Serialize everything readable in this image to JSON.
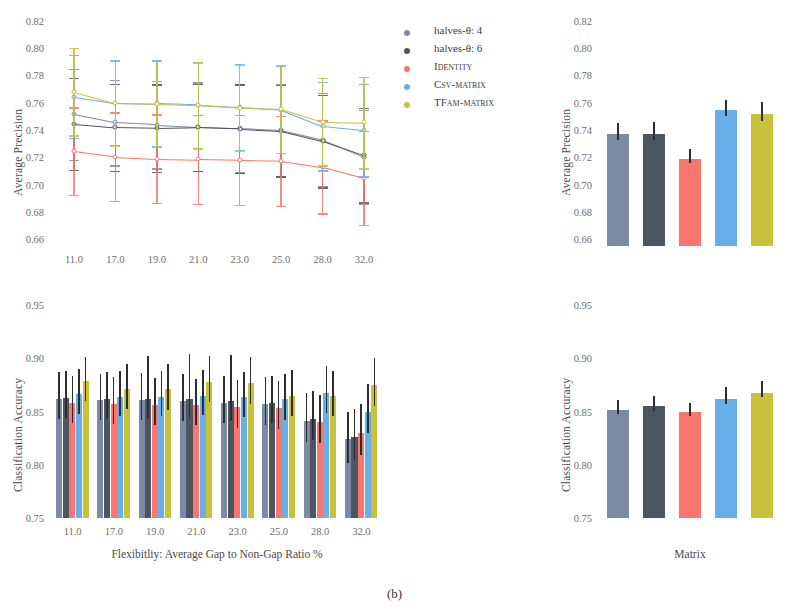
{
  "caption": "(b)",
  "colors": {
    "halves4": "#7b8ba6",
    "halves6": "#4c5560",
    "identity": "#f9766e",
    "csv": "#68aee8",
    "tfam": "#c8c13c",
    "error": "#2d2d2d"
  },
  "legend": {
    "items": [
      {
        "label": "halves-θ: 4",
        "color_key": "halves4",
        "name": "legend-halves-theta-4"
      },
      {
        "label": "halves-θ: 6",
        "color_key": "halves6",
        "name": "legend-halves-theta-6"
      },
      {
        "label": "Identity",
        "color_key": "identity",
        "name": "legend-identity"
      },
      {
        "label": "Csv-matrix",
        "color_key": "csv",
        "name": "legend-csv-matrix"
      },
      {
        "label": "TFam-matrix",
        "color_key": "tfam",
        "name": "legend-tfam-matrix"
      }
    ]
  },
  "chart_data": [
    {
      "id": "top-left",
      "type": "line",
      "title": "",
      "xlabel": "",
      "ylabel": "Average Precision",
      "categories": [
        "11.0",
        "17.0",
        "19.0",
        "21.0",
        "23.0",
        "25.0",
        "28.0",
        "32.0"
      ],
      "ylim": [
        0.655,
        0.825
      ],
      "yticks": [
        "0.82",
        "0.80",
        "0.78",
        "0.76",
        "0.74",
        "0.72",
        "0.70",
        "0.68",
        "0.66"
      ],
      "ytickvals": [
        0.82,
        0.8,
        0.78,
        0.76,
        0.74,
        0.72,
        0.7,
        0.68,
        0.66
      ],
      "grid": false,
      "legend_position": "upper right",
      "series": [
        {
          "name": "halves-θ: 4",
          "color_key": "halves4",
          "values": [
            0.7515,
            0.7455,
            0.744,
            0.7425,
            0.7415,
            0.74,
            0.733,
            0.7205
          ],
          "err_low": [
            0.718,
            0.714,
            0.712,
            0.71,
            0.709,
            0.706,
            0.699,
            0.686
          ],
          "err_high": [
            0.785,
            0.777,
            0.776,
            0.775,
            0.774,
            0.774,
            0.767,
            0.755
          ]
        },
        {
          "name": "halves-θ: 6",
          "color_key": "halves6",
          "values": [
            0.7445,
            0.742,
            0.7415,
            0.742,
            0.741,
            0.7395,
            0.732,
            0.7215
          ],
          "err_low": [
            0.711,
            0.71,
            0.7095,
            0.71,
            0.7085,
            0.706,
            0.698,
            0.687
          ],
          "err_high": [
            0.778,
            0.774,
            0.7735,
            0.774,
            0.7735,
            0.773,
            0.766,
            0.756
          ]
        },
        {
          "name": "Identity",
          "color_key": "identity",
          "values": [
            0.7245,
            0.7205,
            0.719,
            0.7185,
            0.718,
            0.7175,
            0.713,
            0.705
          ],
          "err_low": [
            0.6925,
            0.688,
            0.6865,
            0.686,
            0.685,
            0.6845,
            0.679,
            0.6705
          ],
          "err_high": [
            0.7565,
            0.753,
            0.7515,
            0.751,
            0.751,
            0.7505,
            0.747,
            0.7395
          ]
        },
        {
          "name": "Csv-matrix",
          "color_key": "csv",
          "values": [
            0.7645,
            0.76,
            0.7595,
            0.7585,
            0.757,
            0.755,
            0.743,
            0.74
          ],
          "err_low": [
            0.734,
            0.729,
            0.728,
            0.727,
            0.7255,
            0.723,
            0.7105,
            0.706
          ],
          "err_high": [
            0.795,
            0.791,
            0.791,
            0.79,
            0.7885,
            0.787,
            0.7755,
            0.774
          ]
        },
        {
          "name": "TFam-matrix",
          "color_key": "tfam",
          "values": [
            0.768,
            0.7595,
            0.759,
            0.758,
            0.756,
            0.7555,
            0.746,
            0.7455
          ],
          "err_low": [
            0.736,
            0.7285,
            0.7275,
            0.7265,
            0.7245,
            0.7235,
            0.714,
            0.712
          ],
          "err_high": [
            0.8,
            0.7905,
            0.7905,
            0.7895,
            0.7875,
            0.7875,
            0.778,
            0.779
          ]
        }
      ]
    },
    {
      "id": "top-right",
      "type": "bar",
      "title": "",
      "xlabel": "",
      "ylabel": "Average Precision",
      "categories": [
        "halves-θ: 4",
        "halves-θ: 6",
        "Identity",
        "Csv-matrix",
        "TFam-matrix"
      ],
      "color_keys": [
        "halves4",
        "halves6",
        "identity",
        "csv",
        "tfam"
      ],
      "values": [
        0.737,
        0.737,
        0.719,
        0.755,
        0.752
      ],
      "err_low": [
        0.733,
        0.733,
        0.7155,
        0.7505,
        0.7465
      ],
      "err_high": [
        0.745,
        0.7455,
        0.726,
        0.762,
        0.7605
      ],
      "ylim": [
        0.655,
        0.825
      ],
      "yticks": [
        "0.82",
        "0.80",
        "0.78",
        "0.76",
        "0.74",
        "0.72",
        "0.70",
        "0.68",
        "0.66"
      ],
      "ytickvals": [
        0.82,
        0.8,
        0.78,
        0.76,
        0.74,
        0.72,
        0.7,
        0.68,
        0.66
      ],
      "grid": false
    },
    {
      "id": "bottom-left",
      "type": "bar",
      "title": "",
      "xlabel": "Flexibitliy: Average Gap to Non-Gap Ratio %",
      "ylabel": "Classification Accuracy",
      "categories": [
        "11.0",
        "17.0",
        "19.0",
        "21.0",
        "23.0",
        "25.0",
        "28.0",
        "32.0"
      ],
      "ylim": [
        0.75,
        0.955
      ],
      "yticks": [
        "0.95",
        "0.90",
        "0.85",
        "0.80",
        "0.75"
      ],
      "ytickvals": [
        0.95,
        0.9,
        0.85,
        0.8,
        0.75
      ],
      "grid": false,
      "series": [
        {
          "name": "halves-θ: 4",
          "color_key": "halves4",
          "values": [
            0.862,
            0.861,
            0.8605,
            0.86,
            0.8585,
            0.857,
            0.8415,
            0.824
          ],
          "err_low": [
            0.843,
            0.842,
            0.842,
            0.841,
            0.8395,
            0.8375,
            0.8215,
            0.802
          ],
          "err_high": [
            0.8875,
            0.8855,
            0.886,
            0.885,
            0.884,
            0.883,
            0.868,
            0.85
          ]
        },
        {
          "name": "halves-θ: 6",
          "color_key": "halves6",
          "values": [
            0.8625,
            0.8615,
            0.8615,
            0.862,
            0.86,
            0.858,
            0.843,
            0.826
          ],
          "err_low": [
            0.844,
            0.843,
            0.843,
            0.8435,
            0.841,
            0.839,
            0.823,
            0.8045
          ],
          "err_high": [
            0.888,
            0.887,
            0.902,
            0.904,
            0.903,
            0.884,
            0.869,
            0.8525
          ]
        },
        {
          "name": "Identity",
          "color_key": "identity",
          "values": [
            0.858,
            0.8575,
            0.8565,
            0.856,
            0.854,
            0.853,
            0.84,
            0.83
          ],
          "err_low": [
            0.839,
            0.8385,
            0.8375,
            0.837,
            0.835,
            0.834,
            0.8205,
            0.8095
          ],
          "err_high": [
            0.884,
            0.883,
            0.882,
            0.881,
            0.88,
            0.879,
            0.866,
            0.857
          ]
        },
        {
          "name": "Csv-matrix",
          "color_key": "csv",
          "values": [
            0.8665,
            0.864,
            0.864,
            0.865,
            0.8635,
            0.8615,
            0.868,
            0.85
          ],
          "err_low": [
            0.848,
            0.8455,
            0.8455,
            0.8465,
            0.845,
            0.8425,
            0.849,
            0.8295
          ],
          "err_high": [
            0.89,
            0.888,
            0.888,
            0.889,
            0.887,
            0.8855,
            0.893,
            0.876
          ]
        },
        {
          "name": "TFam-matrix",
          "color_key": "tfam",
          "values": [
            0.879,
            0.8715,
            0.871,
            0.8775,
            0.8765,
            0.865,
            0.8645,
            0.8755
          ],
          "err_low": [
            0.86,
            0.8525,
            0.852,
            0.859,
            0.8575,
            0.846,
            0.8455,
            0.8555
          ],
          "err_high": [
            0.901,
            0.895,
            0.8945,
            0.902,
            0.901,
            0.889,
            0.8885,
            0.9
          ]
        }
      ]
    },
    {
      "id": "bottom-right",
      "type": "bar",
      "title": "",
      "xlabel": "Matrix",
      "ylabel": "Classification Accuracy",
      "categories": [
        "halves-θ: 4",
        "halves-θ: 6",
        "Identity",
        "Csv-matrix",
        "TFam-matrix"
      ],
      "color_keys": [
        "halves4",
        "halves6",
        "identity",
        "csv",
        "tfam"
      ],
      "values": [
        0.852,
        0.8555,
        0.85,
        0.862,
        0.868
      ],
      "err_low": [
        0.848,
        0.851,
        0.8455,
        0.8575,
        0.8635
      ],
      "err_high": [
        0.861,
        0.8645,
        0.858,
        0.873,
        0.879
      ],
      "ylim": [
        0.75,
        0.955
      ],
      "yticks": [
        "0.95",
        "0.90",
        "0.85",
        "0.80",
        "0.75"
      ],
      "ytickvals": [
        0.95,
        0.9,
        0.85,
        0.8,
        0.75
      ],
      "grid": false
    }
  ]
}
